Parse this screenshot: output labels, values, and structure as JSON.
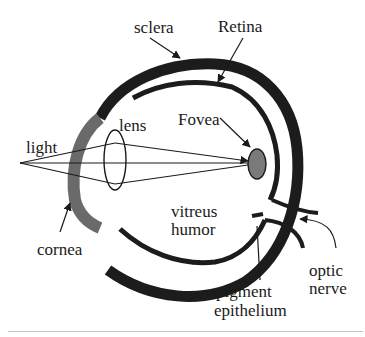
{
  "diagram": {
    "colors": {
      "sclera": "#1c1c1c",
      "retina": "#1c1c1c",
      "cornea": "#6a6a6a",
      "fovea": "#7a7a7a",
      "lines": "#1a1a1a",
      "background": "#ffffff",
      "bottom_rule": "#c4c4c4"
    },
    "labels": {
      "sclera": "sclera",
      "retina": "Retina",
      "lens": "lens",
      "fovea": "Fovea",
      "light": "light",
      "vitreus_line1": "vitreus",
      "vitreus_line2": "humor",
      "cornea": "cornea",
      "optic_line1": "optic",
      "optic_line2": "nerve",
      "pigment_line1": "pigment",
      "pigment_line2": "epithelium"
    }
  }
}
